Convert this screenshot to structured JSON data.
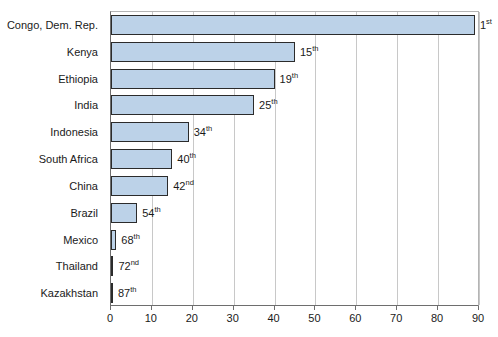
{
  "chart_data": {
    "type": "bar",
    "orientation": "horizontal",
    "title": "",
    "xlabel": "",
    "ylabel": "",
    "xlim": [
      0,
      90
    ],
    "xticks": [
      0,
      10,
      20,
      30,
      40,
      50,
      60,
      70,
      80,
      90
    ],
    "grid": true,
    "legend": "none",
    "categories": [
      "Congo, Dem. Rep.",
      "Kenya",
      "Ethiopia",
      "India",
      "Indonesia",
      "South Africa",
      "China",
      "Brazil",
      "Mexico",
      "Thailand",
      "Kazakhstan"
    ],
    "values": [
      89,
      45,
      40,
      35,
      19,
      15,
      14,
      6.4,
      1.3,
      0.6,
      0.2
    ],
    "annotations": [
      "1st",
      "15th",
      "19th",
      "25th",
      "34th",
      "40th",
      "42nd",
      "54th",
      "68th",
      "72nd",
      "87th"
    ],
    "annotation_ranks": [
      1,
      15,
      19,
      25,
      34,
      40,
      42,
      54,
      68,
      72,
      87
    ],
    "annotation_suffixes": [
      "st",
      "th",
      "th",
      "th",
      "th",
      "th",
      "nd",
      "th",
      "th",
      "nd",
      "th"
    ],
    "bar_fill_color": "#bcd2e8",
    "bar_border_color": "#2b2b2b",
    "gridline_color": "#c8c8c8",
    "axis_color": "#6e6e6e"
  }
}
